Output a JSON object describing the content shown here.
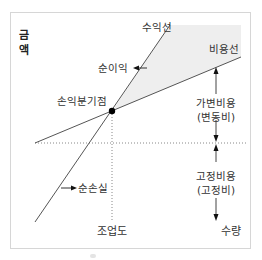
{
  "diagram": {
    "y_axis_label_line1": "금",
    "y_axis_label_line2": "액",
    "x_axis_label": "수량",
    "labels": {
      "revenue_line": "수익선",
      "cost_line": "비용선",
      "net_profit": "순이익",
      "net_loss": "순손실",
      "break_even_point": "손익분기점",
      "variable_cost_line1": "가변비용",
      "variable_cost_line2": "(변동비)",
      "fixed_cost_line1": "고정비용",
      "fixed_cost_line2": "(고정비)",
      "operating_level": "조업도"
    },
    "colors": {
      "line": "#555555",
      "profit_fill": "#eeeeee",
      "dot": "#000000",
      "frame": "#d6d6d6",
      "guide": "#888888"
    }
  }
}
